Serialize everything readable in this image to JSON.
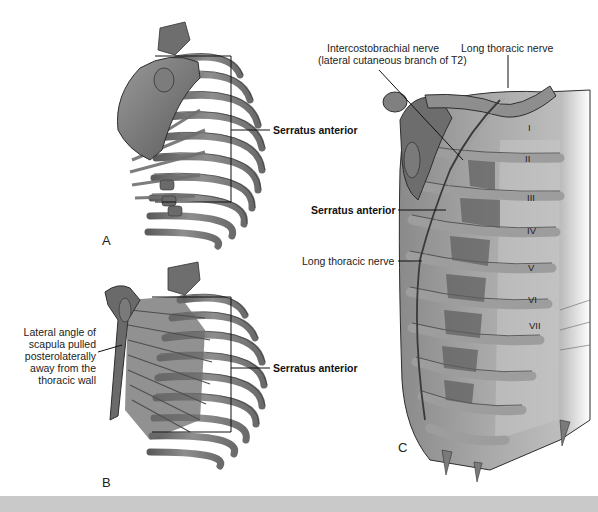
{
  "figure": {
    "panels": [
      {
        "letter": "A",
        "labels": [
          {
            "text": "Serratus anterior",
            "bold": true
          }
        ]
      },
      {
        "letter": "B",
        "labels": [
          {
            "text": "Lateral angle of\nscapula pulled\nposterolaterally\naway from the\nthoracic wall",
            "bold": false,
            "lines": [
              "Lateral angle of",
              "scapula pulled",
              "posterolaterally",
              "away from the",
              "thoracic wall"
            ]
          },
          {
            "text": "Serratus anterior",
            "bold": true
          }
        ]
      },
      {
        "letter": "C",
        "labels": [
          {
            "text": "Intercostobrachial nerve",
            "sub": "(lateral cutaneous branch of T2)",
            "bold": false
          },
          {
            "text": "Long thoracic nerve",
            "bold": false
          },
          {
            "text": "Serratus anterior",
            "bold": true
          },
          {
            "text": "Long thoracic nerve",
            "bold": false
          }
        ],
        "rib_numerals": [
          "I",
          "II",
          "III",
          "IV",
          "V",
          "VI",
          "VII"
        ]
      }
    ],
    "caption_partial": "... lateral wall of the thorax: serratus anterior muscle and long thoracic nerve (partially cropped caption) ..."
  },
  "colors": {
    "background": "#ffffff",
    "bone": "#8a8a8a",
    "bone_dark": "#4a4a4a",
    "muscle": "#7a7a7a",
    "light_panel": "#b8b8b8",
    "caption_band": "#c9c9c9",
    "text": "#222222"
  }
}
